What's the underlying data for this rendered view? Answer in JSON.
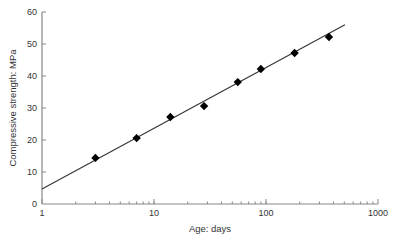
{
  "chart_data": {
    "type": "scatter",
    "title": "",
    "xlabel": "Age: days",
    "ylabel": "Compressive strength: MPa",
    "xscale": "log",
    "xlim": [
      1,
      1000
    ],
    "ylim": [
      0,
      60
    ],
    "x_ticks": [
      1,
      10,
      100,
      1000
    ],
    "x_tick_labels": [
      "1",
      "10",
      "100",
      "1000"
    ],
    "y_ticks": [
      0,
      10,
      20,
      30,
      40,
      50,
      60
    ],
    "y_tick_labels": [
      "0",
      "10",
      "20",
      "30",
      "40",
      "50",
      "60"
    ],
    "grid": false,
    "legend": null,
    "series": [
      {
        "name": "Measured",
        "marker": "diamond",
        "color": "#000000",
        "x": [
          3,
          7,
          14,
          28,
          56,
          90,
          180,
          365
        ],
        "y": [
          14.4,
          20.6,
          27.2,
          30.6,
          38.1,
          42.2,
          47.2,
          52.2
        ]
      },
      {
        "name": "Fit (log-linear)",
        "type": "line",
        "color": "#333333",
        "x": [
          1,
          507
        ],
        "y": [
          4.7,
          56.0
        ]
      }
    ]
  },
  "colors": {
    "axis": "#888888",
    "text": "#333333",
    "marker": "#000000",
    "line": "#333333"
  }
}
